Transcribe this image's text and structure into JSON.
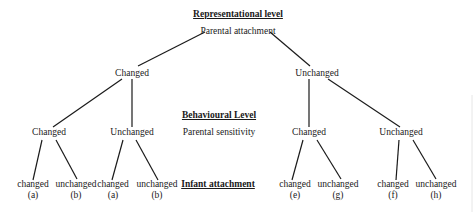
{
  "levels": {
    "representational": "Representational level",
    "behavioural": "Behavioural Level",
    "infant": "Infant attachment"
  },
  "root": {
    "label": "Parental attachment"
  },
  "level1": [
    {
      "label": "Changed"
    },
    {
      "label": "Unchanged"
    }
  ],
  "level2_label": "Parental sensitivity",
  "level2": [
    {
      "label": "Changed"
    },
    {
      "label": "Unchanged"
    },
    {
      "label": "Changed"
    },
    {
      "label": "Unchanged"
    }
  ],
  "leaves": [
    {
      "label": "changed",
      "code": "(a)"
    },
    {
      "label": "unchanged",
      "code": "(b)"
    },
    {
      "label": "changed",
      "code": "(a)"
    },
    {
      "label": "unchanged",
      "code": "(b)"
    },
    {
      "label": "changed",
      "code": "(e)"
    },
    {
      "label": "unchanged",
      "code": "(g)"
    },
    {
      "label": "changed",
      "code": "(f)"
    },
    {
      "label": "unchanged",
      "code": "(h)"
    }
  ]
}
